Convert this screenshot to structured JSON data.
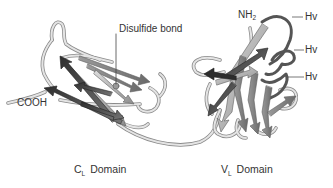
{
  "figure": {
    "labels": {
      "disulfide": "Disulfide bond",
      "cooh": "COOH",
      "nh2_main": "NH",
      "nh2_sub": "2",
      "hv1": "Hv",
      "hv2": "Hv",
      "hv3": "Hv"
    },
    "domains": [
      {
        "main": "C",
        "sub": "L",
        "rest": "Domain"
      },
      {
        "main": "V",
        "sub": "L",
        "rest": "Domain"
      }
    ],
    "colors": {
      "background": "#ffffff",
      "coil_fill": "#e4e4e4",
      "coil_stroke": "#8a8a8a",
      "strand_dark": "#3a3a3a",
      "strand_mid": "#7a7a7a",
      "strand_light": "#b8b8b8",
      "hv_loop": "#555555",
      "text": "#333333"
    }
  }
}
